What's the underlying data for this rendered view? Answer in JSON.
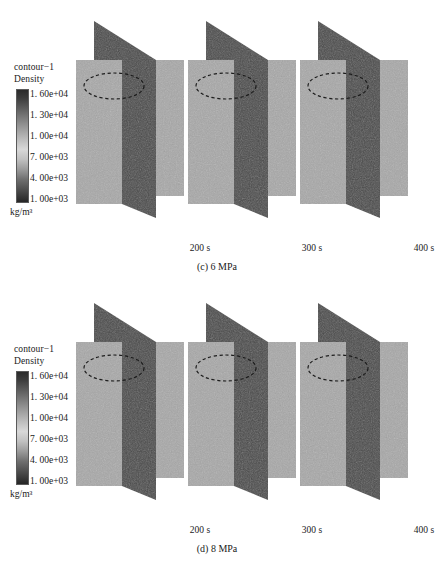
{
  "figure": {
    "background": "#ffffff",
    "panel_light_color": "#a8a8a8",
    "panel_dark_color": "#4a4a4a",
    "panel_roof_color": "#4a4a4a",
    "annotation_color": "#1c1c1c"
  },
  "legend": {
    "title_line1": "contour−1",
    "title_line2": "Density",
    "units": "kg/m³",
    "ticks": [
      "1. 60e+04",
      "1. 30e+04",
      "1. 00e+04",
      "7. 00e+03",
      "4. 00e+03",
      "1. 00e+03"
    ],
    "tick_values": [
      16000,
      13000,
      10000,
      7000,
      4000,
      1000
    ]
  },
  "subfigures": [
    {
      "id": "c",
      "caption": "(c) 6 MPa",
      "pressure_mpa": 6,
      "frames": [
        {
          "time_label": "200 s",
          "time_s": 200
        },
        {
          "time_label": "300 s",
          "time_s": 300
        },
        {
          "time_label": "400 s",
          "time_s": 400
        }
      ]
    },
    {
      "id": "d",
      "caption": "(d) 8 MPa",
      "pressure_mpa": 8,
      "frames": [
        {
          "time_label": "200 s",
          "time_s": 200
        },
        {
          "time_label": "300 s",
          "time_s": 300
        },
        {
          "time_label": "400 s",
          "time_s": 400
        }
      ]
    }
  ]
}
